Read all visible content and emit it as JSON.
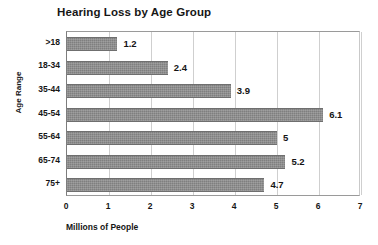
{
  "chart_data": {
    "type": "bar",
    "orientation": "horizontal",
    "title": "Hearing Loss by Age Group",
    "xlabel": "Millions of People",
    "ylabel": "Age Range",
    "categories": [
      ">18",
      "18-34",
      "35-44",
      "45-54",
      "55-64",
      "65-74",
      "75+"
    ],
    "values": [
      1.2,
      2.4,
      3.9,
      6.1,
      5,
      5.2,
      4.7
    ],
    "value_labels": [
      "1.2",
      "2.4",
      "3.9",
      "6.1",
      "5",
      "5.2",
      "4.7"
    ],
    "xlim": [
      0,
      7
    ],
    "xticks": [
      0,
      1,
      2,
      3,
      4,
      5,
      6,
      7
    ],
    "xtick_labels": [
      "0",
      "1",
      "2",
      "3",
      "4",
      "5",
      "6",
      "7"
    ],
    "grid": "vertical",
    "legend": null,
    "bar_color": "#7f7f7f",
    "text_color": "#161616"
  }
}
